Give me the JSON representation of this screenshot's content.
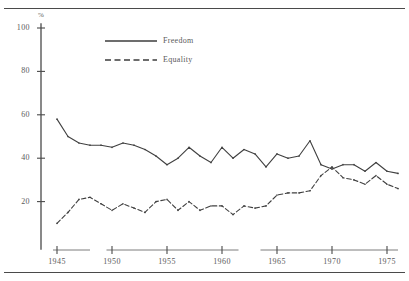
{
  "chart_data": {
    "type": "line",
    "title": "",
    "subtitle": "",
    "xlabel": "",
    "ylabel": "%",
    "ylim": [
      0,
      100
    ],
    "xlim": [
      1945,
      1976
    ],
    "grid": false,
    "legend_position": "top-center",
    "y_ticks": [
      100,
      80,
      60,
      40,
      20
    ],
    "x_ticks": [
      1945,
      1950,
      1955,
      1960,
      1965,
      1970,
      1975
    ],
    "x": [
      1945,
      1946,
      1947,
      1948,
      1949,
      1950,
      1951,
      1952,
      1953,
      1954,
      1955,
      1956,
      1957,
      1958,
      1959,
      1960,
      1961,
      1962,
      1963,
      1964,
      1965,
      1966,
      1967,
      1968,
      1969,
      1970,
      1971,
      1972,
      1973,
      1974,
      1975,
      1976
    ],
    "series": [
      {
        "name": "Freedom",
        "style": "solid",
        "color": "#404040",
        "values": [
          58,
          50,
          47,
          46,
          46,
          45,
          47,
          46,
          44,
          41,
          37,
          40,
          45,
          41,
          38,
          45,
          40,
          44,
          42,
          36,
          42,
          40,
          41,
          48,
          37,
          35,
          37,
          37,
          34,
          38,
          34,
          33
        ]
      },
      {
        "name": "Equality",
        "style": "dashed",
        "color": "#404040",
        "values": [
          10,
          15,
          21,
          22,
          19,
          16,
          19,
          17,
          15,
          20,
          21,
          16,
          20,
          16,
          18,
          18,
          14,
          18,
          17,
          18,
          23,
          24,
          24,
          25,
          32,
          36,
          31,
          30,
          28,
          32,
          28,
          26
        ]
      }
    ]
  },
  "legend": {
    "entries": [
      {
        "label": "Freedom",
        "style": "solid"
      },
      {
        "label": "Equality",
        "style": "dashed"
      }
    ]
  },
  "axes": {
    "y_unit": "%",
    "y_tick_labels": [
      "100",
      "80",
      "60",
      "40",
      "20"
    ],
    "x_tick_labels": [
      "1945",
      "1950",
      "1955",
      "1960",
      "1965",
      "1970",
      "1975"
    ]
  }
}
